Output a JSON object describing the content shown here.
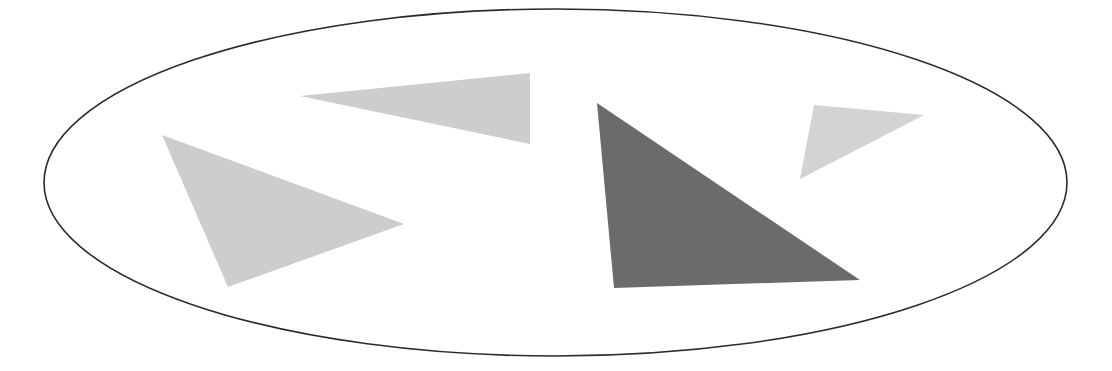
{
  "diagram": {
    "background": "#ffffff",
    "ellipse": {
      "cx": 555.5,
      "cy": 182.5,
      "rx": 511.5,
      "ry": 173.5,
      "stroke": "#2b2b2b",
      "stroke_width": 1.6,
      "fill": "none"
    },
    "triangles": [
      {
        "name": "light-triangle-left",
        "points": "162,135 404,224 228,287",
        "fill": "#cdcdcd"
      },
      {
        "name": "light-triangle-top",
        "points": "300,96 530,73 530,144",
        "fill": "#cdcdcd"
      },
      {
        "name": "dark-triangle",
        "points": "597,103 614,288 860,280",
        "fill": "#6b6b6b"
      },
      {
        "name": "light-triangle-small",
        "points": "814,105 924,115 800,179",
        "fill": "#d3d3d3"
      }
    ]
  }
}
